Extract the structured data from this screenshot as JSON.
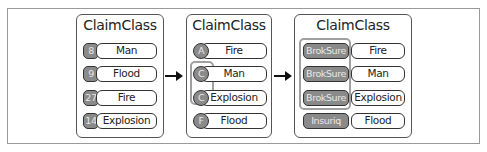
{
  "panels": [
    {
      "title": "ClaimClass",
      "rows": [
        {
          "key": "8",
          "value": "Man"
        },
        {
          "key": "9",
          "value": "Flood"
        },
        {
          "key": "27",
          "value": "Fire"
        },
        {
          "key": "14",
          "value": "Explosion"
        }
      ]
    },
    {
      "title": "ClaimClass",
      "rows": [
        {
          "key": "A",
          "value": "Fire"
        },
        {
          "key": "C",
          "value": "Man"
        },
        {
          "key": "C",
          "value": "Explosion"
        },
        {
          "key": "F",
          "value": "Flood"
        }
      ]
    },
    {
      "title": "ClaimClass",
      "rows": [
        {
          "key": "BrokSure",
          "value": "Fire"
        },
        {
          "key": "BrokSure",
          "value": "Man"
        },
        {
          "key": "BrokSure",
          "value": "Explosion"
        },
        {
          "key": "Insuriq",
          "value": "Flood"
        }
      ]
    }
  ],
  "colors": {
    "key_fill": "#8a8a8a",
    "border": "#333333",
    "group_highlight": "#a0a0a0"
  }
}
